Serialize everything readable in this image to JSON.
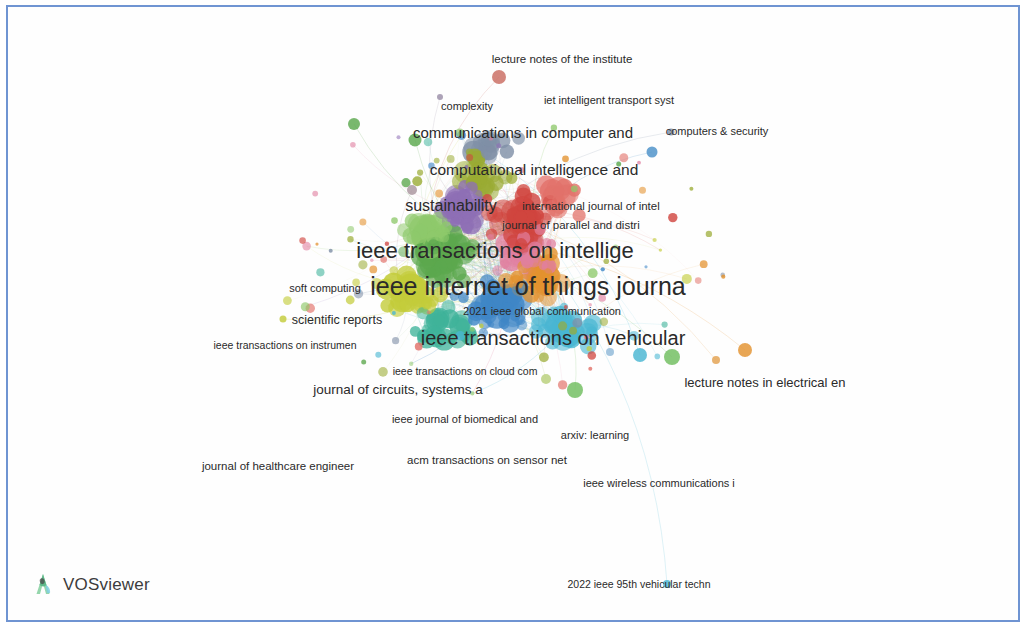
{
  "app": {
    "name": "VOSviewer",
    "logo_icon": "vosviewer-leaf-icon",
    "canvas_background": "#fefefe",
    "border_color": "#6f94d2"
  },
  "visualization": {
    "type": "bibliometric-network-map",
    "unit_of_analysis": "sources",
    "label_color": "#2a2a2a"
  },
  "cluster_colors": {
    "green": "#5ca84e",
    "red": "#d0453f",
    "blue": "#3f86c6",
    "orange": "#e3922f",
    "purple": "#8e6fb5",
    "yellow_green": "#c3cc3a",
    "cyan": "#49b6d2",
    "pink": "#e07fa0",
    "teal": "#3fb39a",
    "olive": "#9aab33",
    "light_green": "#8ec96b",
    "salmon": "#e2726a",
    "grey_blue": "#7f8fa6"
  },
  "labels": [
    {
      "text": "lecture notes of the institute",
      "x": 554,
      "y": 52,
      "size": 11.5,
      "weight": "400"
    },
    {
      "text": "complexity",
      "x": 459,
      "y": 99,
      "size": 11,
      "weight": "400"
    },
    {
      "text": "iet intelligent transport syst",
      "x": 601,
      "y": 93,
      "size": 11,
      "weight": "400"
    },
    {
      "text": "communications in computer and",
      "x": 515,
      "y": 125,
      "size": 15,
      "weight": "400"
    },
    {
      "text": "computers & security",
      "x": 709,
      "y": 124,
      "size": 11,
      "weight": "400"
    },
    {
      "text": "computational intelligence and",
      "x": 526,
      "y": 163,
      "size": 15.5,
      "weight": "400"
    },
    {
      "text": "sustainability",
      "x": 443,
      "y": 199,
      "size": 16,
      "weight": "400"
    },
    {
      "text": "international journal of intel",
      "x": 583,
      "y": 199,
      "size": 11.5,
      "weight": "400"
    },
    {
      "text": "journal of parallel and distri",
      "x": 563,
      "y": 218,
      "size": 11.5,
      "weight": "400"
    },
    {
      "text": "ieee transactions on intellige",
      "x": 487,
      "y": 244,
      "size": 22,
      "weight": "400"
    },
    {
      "text": "soft computing",
      "x": 317,
      "y": 281,
      "size": 11,
      "weight": "400"
    },
    {
      "text": "ieee internet of things journa",
      "x": 520,
      "y": 279,
      "size": 25,
      "weight": "400"
    },
    {
      "text": "scientific reports",
      "x": 329,
      "y": 313,
      "size": 12.5,
      "weight": "400"
    },
    {
      "text": "2021 ieee global communication",
      "x": 534,
      "y": 304,
      "size": 11,
      "weight": "400"
    },
    {
      "text": "ieee transactions on vehicular",
      "x": 545,
      "y": 331,
      "size": 20,
      "weight": "400"
    },
    {
      "text": "ieee transactions on instrumen",
      "x": 277,
      "y": 338,
      "size": 10.5,
      "weight": "400"
    },
    {
      "text": "ieee transactions on cloud com",
      "x": 457,
      "y": 364,
      "size": 10.5,
      "weight": "400"
    },
    {
      "text": "lecture notes in electrical en",
      "x": 757,
      "y": 375,
      "size": 13,
      "weight": "400"
    },
    {
      "text": "journal of circuits, systems a",
      "x": 390,
      "y": 382,
      "size": 13.5,
      "weight": "400"
    },
    {
      "text": "ieee journal of biomedical and",
      "x": 457,
      "y": 412,
      "size": 11,
      "weight": "400"
    },
    {
      "text": "arxiv: learning",
      "x": 587,
      "y": 428,
      "size": 11,
      "weight": "400"
    },
    {
      "text": "acm transactions on sensor net",
      "x": 479,
      "y": 453,
      "size": 11.5,
      "weight": "400"
    },
    {
      "text": "journal of healthcare engineer",
      "x": 270,
      "y": 459,
      "size": 11.5,
      "weight": "400"
    },
    {
      "text": "ieee wireless communications i",
      "x": 651,
      "y": 476,
      "size": 11,
      "weight": "400"
    },
    {
      "text": "2022 ieee 95th vehicular techn",
      "x": 631,
      "y": 577,
      "size": 10.5,
      "weight": "400"
    }
  ],
  "outlier_nodes": [
    {
      "x": 346,
      "y": 117,
      "r": 6,
      "color": "#5ca84e"
    },
    {
      "x": 432,
      "y": 90,
      "r": 3,
      "color": "#9b8fa8"
    },
    {
      "x": 491,
      "y": 70,
      "r": 7,
      "color": "#c96b60"
    },
    {
      "x": 407,
      "y": 133,
      "r": 6.5,
      "color": "#5ca84e"
    },
    {
      "x": 404,
      "y": 183,
      "r": 5,
      "color": "#a9969f"
    },
    {
      "x": 275,
      "y": 312,
      "r": 3.5,
      "color": "#c3cc3a"
    },
    {
      "x": 708,
      "y": 353,
      "r": 4,
      "color": "#e3a14f"
    },
    {
      "x": 737,
      "y": 343,
      "r": 7,
      "color": "#e3922f"
    },
    {
      "x": 664,
      "y": 350,
      "r": 8,
      "color": "#6fbd5e"
    },
    {
      "x": 632,
      "y": 348,
      "r": 7,
      "color": "#49b6d2"
    },
    {
      "x": 602,
      "y": 345,
      "r": 4,
      "color": "#8fb8d8"
    },
    {
      "x": 659,
      "y": 577,
      "r": 4,
      "color": "#49b6d2"
    },
    {
      "x": 567,
      "y": 383,
      "r": 8,
      "color": "#6fbd5e"
    },
    {
      "x": 538,
      "y": 372,
      "r": 5,
      "color": "#b8cf7a"
    },
    {
      "x": 663,
      "y": 125,
      "r": 3.5,
      "color": "#7f8fa6"
    },
    {
      "x": 644,
      "y": 145,
      "r": 5.5,
      "color": "#4a90c8"
    }
  ],
  "core": {
    "center_x": 500,
    "center_y": 255,
    "description": "dense overlapping multi-cluster node cloud"
  }
}
